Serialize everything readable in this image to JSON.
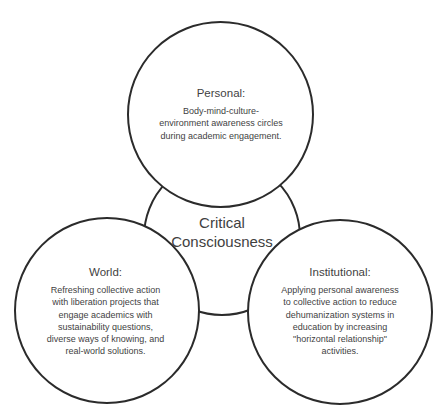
{
  "diagram": {
    "center": {
      "title_line1": "Critical",
      "title_line2": "Consciousness"
    },
    "personal": {
      "title": "Personal:",
      "lines": [
        "Body-mind-culture-",
        "environment awareness circles",
        "during academic engagement."
      ]
    },
    "world": {
      "title": "World:",
      "lines": [
        "Refreshing collective action",
        "with liberation projects that",
        "engage academics with",
        "sustainability questions,",
        "diverse ways of knowing, and",
        "real-world solutions."
      ]
    },
    "institutional": {
      "title": "Institutional:",
      "lines": [
        "Applying personal awareness",
        "to collective action to reduce",
        "dehumanization systems in",
        "education by increasing",
        "\"horizontal relationship\"",
        "activities."
      ]
    },
    "colors": {
      "stroke": "#2b2b2b",
      "text": "#3f3f3f",
      "fill": "#ffffff"
    }
  }
}
